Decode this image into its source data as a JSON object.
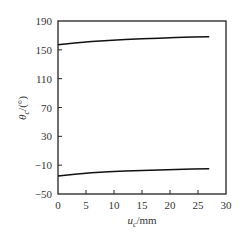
{
  "chart_data": {
    "type": "line",
    "title": "",
    "xlabel": "u_c/mm",
    "ylabel": "θ_c/(°)",
    "xlim": [
      0,
      30
    ],
    "ylim": [
      -50,
      190
    ],
    "xticks": [
      0,
      5,
      10,
      15,
      20,
      25,
      30
    ],
    "yticks": [
      -50,
      -10,
      30,
      70,
      110,
      150,
      190
    ],
    "grid": false,
    "legend": null,
    "series": [
      {
        "name": "upper",
        "x": [
          0,
          3,
          6,
          9,
          12,
          15,
          18,
          21,
          24,
          27
        ],
        "y": [
          157,
          159.5,
          161.5,
          163,
          164.3,
          165.3,
          166.2,
          167,
          167.6,
          168.2
        ]
      },
      {
        "name": "lower",
        "x": [
          0,
          3,
          6,
          9,
          12,
          15,
          18,
          21,
          24,
          27
        ],
        "y": [
          -25,
          -22.5,
          -20.6,
          -19.2,
          -18.1,
          -17.2,
          -16.5,
          -15.9,
          -15.4,
          -15
        ]
      }
    ]
  },
  "labels": {
    "xlabel_main": "u",
    "xlabel_sub": "c",
    "xlabel_unit": "/mm",
    "ylabel_main": "θ",
    "ylabel_sub": "c",
    "ylabel_unit": "/(°)"
  }
}
